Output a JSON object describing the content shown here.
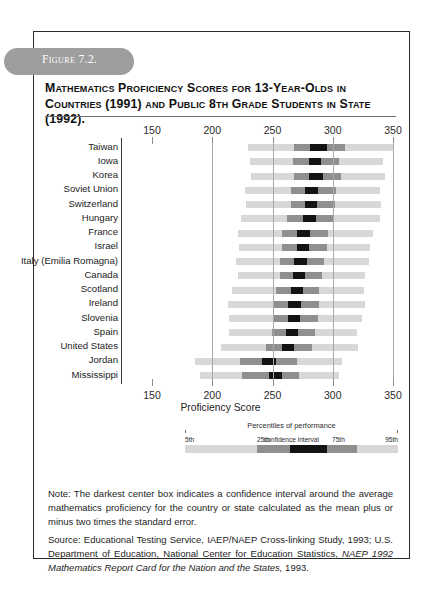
{
  "figure": {
    "pill_label": "Figure 7.2.",
    "title": "Mathematics Proficiency Scores for 13-Year-Olds in Countries (1991) and Public 8th Grade Students in State (1992)."
  },
  "chart_data": {
    "type": "bar",
    "title": "Mathematics Proficiency Scores for 13-Year-Olds in Countries (1991) and Public 8th Grade Students in State (1992).",
    "xlabel": "Proficiency Score",
    "ylabel": "",
    "xlim": [
      150,
      350
    ],
    "xticks": [
      150,
      200,
      250,
      300,
      350
    ],
    "xtick_labels": [
      "150",
      "200",
      "250",
      "300",
      "350"
    ],
    "grid": true,
    "legend_position": "below-axis",
    "orientation": "horizontal",
    "series_names": [
      "5th",
      "25th",
      "confidence interval",
      "75th",
      "95th"
    ],
    "categories": [
      "Taiwan",
      "Iowa",
      "Korea",
      "Soviet Union",
      "Switzerland",
      "Hungary",
      "France",
      "Israel",
      "Italy (Emilia Romagna)",
      "Canada",
      "Scotland",
      "Ireland",
      "Slovenia",
      "Spain",
      "United States",
      "Jordan",
      "Mississippi"
    ],
    "rows": [
      {
        "label": "Taiwan",
        "p5": 230,
        "p25": 268,
        "ci_low": 281,
        "ci_high": 295,
        "p75": 310,
        "p95": 350
      },
      {
        "label": "Iowa",
        "p5": 231,
        "p25": 267,
        "ci_low": 280,
        "ci_high": 290,
        "p75": 305,
        "p95": 342
      },
      {
        "label": "Korea",
        "p5": 232,
        "p25": 268,
        "ci_low": 280,
        "ci_high": 292,
        "p75": 307,
        "p95": 343
      },
      {
        "label": "Soviet Union",
        "p5": 227,
        "p25": 265,
        "ci_low": 277,
        "ci_high": 288,
        "p75": 303,
        "p95": 339
      },
      {
        "label": "Switzerland",
        "p5": 228,
        "p25": 265,
        "ci_low": 277,
        "ci_high": 287,
        "p75": 302,
        "p95": 340
      },
      {
        "label": "Hungary",
        "p5": 224,
        "p25": 262,
        "ci_low": 275,
        "ci_high": 286,
        "p75": 301,
        "p95": 339
      },
      {
        "label": "France",
        "p5": 221,
        "p25": 258,
        "ci_low": 270,
        "ci_high": 281,
        "p75": 296,
        "p95": 333
      },
      {
        "label": "Israel",
        "p5": 222,
        "p25": 258,
        "ci_low": 270,
        "ci_high": 280,
        "p75": 295,
        "p95": 331
      },
      {
        "label": "Italy (Emilia Romagna)",
        "p5": 220,
        "p25": 256,
        "ci_low": 268,
        "ci_high": 279,
        "p75": 293,
        "p95": 330
      },
      {
        "label": "Canada",
        "p5": 221,
        "p25": 256,
        "ci_low": 267,
        "ci_high": 277,
        "p75": 291,
        "p95": 327
      },
      {
        "label": "Scotland",
        "p5": 216,
        "p25": 253,
        "ci_low": 265,
        "ci_high": 275,
        "p75": 289,
        "p95": 326
      },
      {
        "label": "Ireland",
        "p5": 213,
        "p25": 251,
        "ci_low": 263,
        "ci_high": 274,
        "p75": 289,
        "p95": 327
      },
      {
        "label": "Slovenia",
        "p5": 214,
        "p25": 251,
        "ci_low": 263,
        "ci_high": 273,
        "p75": 288,
        "p95": 324
      },
      {
        "label": "Spain",
        "p5": 214,
        "p25": 250,
        "ci_low": 261,
        "ci_high": 271,
        "p75": 285,
        "p95": 320
      },
      {
        "label": "United States",
        "p5": 207,
        "p25": 245,
        "ci_low": 258,
        "ci_high": 268,
        "p75": 283,
        "p95": 321
      },
      {
        "label": "Jordan",
        "p5": 186,
        "p25": 223,
        "ci_low": 241,
        "ci_high": 253,
        "p75": 270,
        "p95": 308
      },
      {
        "label": "Mississippi",
        "p5": 190,
        "p25": 225,
        "ci_low": 247,
        "ci_high": 258,
        "p75": 272,
        "p95": 305
      }
    ]
  },
  "legend": {
    "caption": "Percentiles of performance",
    "p5": "5th",
    "p25": "25th",
    "ci": "confidence interval",
    "p75": "75th",
    "p95": "95th"
  },
  "notes": {
    "note": "Note: The darkest center box indicates a confidence interval around the average mathematics proficiency for the country or state calculated as the mean plus or minus two times the standard error.",
    "source_prefix": "Source: Educational Testing Service, IAEP/NAEP Cross-linking Study, 1993; U.S. Department of Education, National Center for Education Statistics, ",
    "source_italic": "NAEP 1992 Mathematics Report Card for the Nation and the States,",
    "source_suffix": " 1993."
  },
  "colors": {
    "band_outer": "#d8d8d8",
    "band_mid": "#8f8f8f",
    "band_ci": "#131313",
    "frame": "#2b2b2b",
    "pill": "#9e9e9e"
  }
}
